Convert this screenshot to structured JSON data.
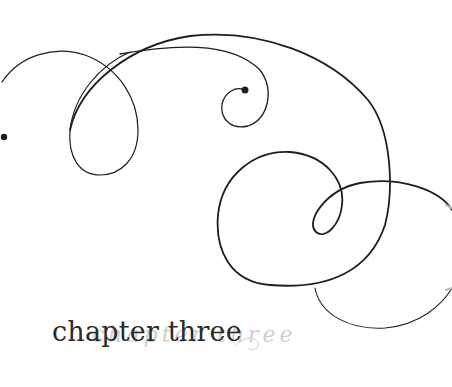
{
  "artwork": {
    "description": "Decorative calligraphic flourish",
    "stroke_color": "#1e1e1e",
    "ghost_color": "#cfcfcf"
  },
  "heading": {
    "text": "chapter three",
    "ghost_text": "chapter three"
  }
}
